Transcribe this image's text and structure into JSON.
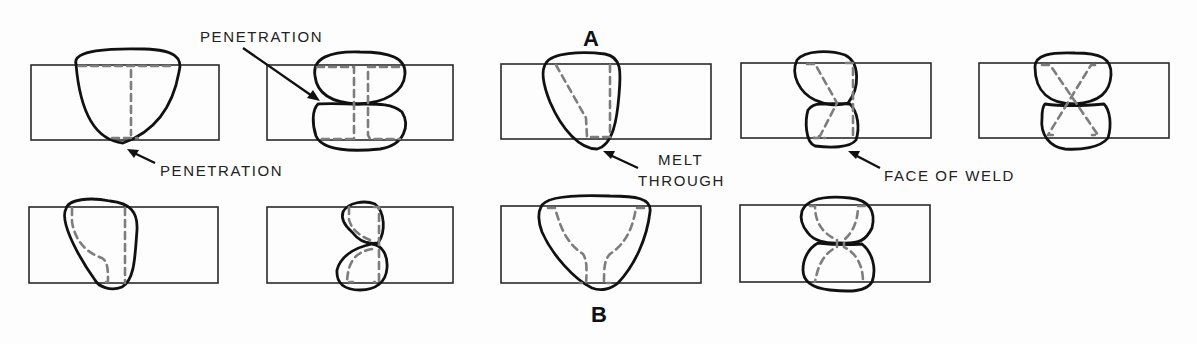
{
  "diagram": {
    "group_labels": {
      "a": "A",
      "b": "B"
    },
    "callouts": {
      "penetration_top": "PENETRATION",
      "penetration_bottom": "PENETRATION",
      "melt_through_line1": "MELT",
      "melt_through_line2": "THROUGH",
      "face_of_weld": "FACE OF WELD"
    },
    "colors": {
      "outline": "#111111",
      "plate_edge": "#2a2a2a",
      "joint_dashed": "#7d7d7d",
      "background": "#fdfdfd"
    },
    "figures": [
      {
        "row": "top",
        "index": 1,
        "joint": "square groove, single-side",
        "bead": "single pass"
      },
      {
        "row": "top",
        "index": 2,
        "joint": "square groove, double-side",
        "bead": "two passes"
      },
      {
        "row": "top",
        "index": 3,
        "joint": "bevel groove",
        "bead": "single pass with melt-through"
      },
      {
        "row": "top",
        "index": 4,
        "joint": "double bevel",
        "bead": "two passes"
      },
      {
        "row": "top",
        "index": 5,
        "joint": "double V groove",
        "bead": "two passes"
      },
      {
        "row": "bottom",
        "index": 1,
        "joint": "J groove",
        "bead": "single pass"
      },
      {
        "row": "bottom",
        "index": 2,
        "joint": "double J groove",
        "bead": "two passes"
      },
      {
        "row": "bottom",
        "index": 3,
        "joint": "U groove",
        "bead": "single pass"
      },
      {
        "row": "bottom",
        "index": 4,
        "joint": "double U groove",
        "bead": "two passes"
      }
    ]
  }
}
